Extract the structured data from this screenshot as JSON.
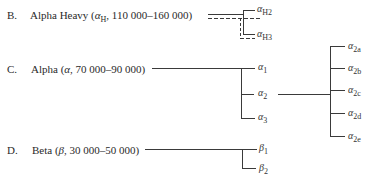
{
  "diagram": {
    "groups": [
      {
        "letter": "B.",
        "name": "Alpha Heavy",
        "symbol": "α",
        "symbol_sub": "H",
        "range": ", 110 000–160 000)",
        "subunits": [
          {
            "glyph": "α",
            "sub": "H2"
          },
          {
            "glyph": "α",
            "sub": "H3"
          }
        ]
      },
      {
        "letter": "C.",
        "name": "Alpha",
        "symbol": "α",
        "symbol_sub": "",
        "range": ", 70 000–90 000)",
        "subunits": [
          {
            "glyph": "α",
            "sub": "1"
          },
          {
            "glyph": "α",
            "sub": "2"
          },
          {
            "glyph": "α",
            "sub": "3"
          }
        ],
        "alpha2_subunits": [
          {
            "glyph": "α",
            "sub": "2a"
          },
          {
            "glyph": "α",
            "sub": "2b"
          },
          {
            "glyph": "α",
            "sub": "2c"
          },
          {
            "glyph": "α",
            "sub": "2d"
          },
          {
            "glyph": "α",
            "sub": "2e"
          }
        ]
      },
      {
        "letter": "D.",
        "name": "Beta",
        "symbol": "β",
        "symbol_sub": "",
        "range": ", 30 000–50 000)",
        "subunits": [
          {
            "glyph": "β",
            "sub": "1"
          },
          {
            "glyph": "β",
            "sub": "2"
          }
        ]
      }
    ],
    "paren_open": "(",
    "colors": {
      "line": "#3a3a3a",
      "text": "#2a2a2a"
    }
  }
}
